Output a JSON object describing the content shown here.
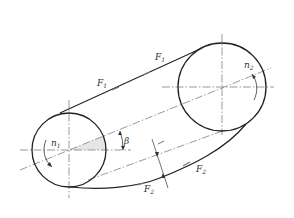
{
  "diagram": {
    "type": "belt-drive",
    "pulleys": [
      {
        "id": "driver",
        "speed_label": "n",
        "speed_sub": "1",
        "center": [
          69,
          150
        ],
        "radius": 37
      },
      {
        "id": "driven",
        "speed_label": "n",
        "speed_sub": "2",
        "center": [
          222,
          87
        ],
        "radius": 44
      }
    ],
    "tension_labels": [
      {
        "label": "F",
        "sub": "1",
        "x": 97,
        "y": 86
      },
      {
        "label": "F",
        "sub": "1",
        "x": 155,
        "y": 60
      },
      {
        "label": "F",
        "sub": "2",
        "x": 196,
        "y": 172
      },
      {
        "label": "F",
        "sub": "2",
        "x": 144,
        "y": 192
      }
    ],
    "angle_label": "β",
    "colors": {
      "line": "#222222",
      "centerline": "#444444",
      "shade": "#e8e8e8"
    }
  }
}
